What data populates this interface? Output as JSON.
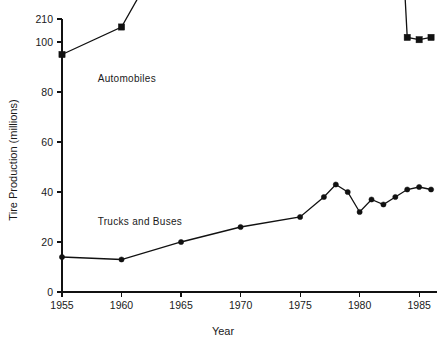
{
  "chart_data": {
    "type": "line",
    "title": "",
    "xlabel": "Year",
    "ylabel": "Tire Production (millions)",
    "xlim": [
      1955,
      1986.5
    ],
    "ylim": [
      0,
      210
    ],
    "grid": false,
    "legend_position": "inline-annotation",
    "x_ticks": [
      "1955",
      "1960",
      "1965",
      "1970",
      "1975",
      "1980",
      "1985"
    ],
    "x_tick_values": [
      1955,
      1960,
      1965,
      1970,
      1975,
      1980,
      1985
    ],
    "y_ticks": [
      "0",
      "20",
      "40",
      "60",
      "80",
      "100",
      "120",
      "140",
      "160",
      "180",
      "200",
      "210"
    ],
    "y_tick_values": [
      0,
      20,
      40,
      60,
      80,
      100,
      120,
      140,
      160,
      180,
      200,
      210
    ],
    "series": [
      {
        "name": "Automobiles",
        "marker": "square",
        "label_x": 1958.0,
        "label_y": 84,
        "x": [
          1955,
          1960,
          1965,
          1970,
          1975,
          1977,
          1978,
          1979,
          1980,
          1981,
          1982,
          1983,
          1984,
          1985,
          1986
        ],
        "values": [
          95,
          106,
          148,
          169,
          167,
          190,
          193,
          168,
          146,
          165,
          168,
          191,
          202,
          201,
          202
        ]
      },
      {
        "name": "Trucks and Buses",
        "marker": "circle",
        "label_x": 1958.0,
        "label_y": 27,
        "x": [
          1955,
          1960,
          1965,
          1970,
          1975,
          1977,
          1978,
          1979,
          1980,
          1981,
          1982,
          1983,
          1984,
          1985,
          1986
        ],
        "values": [
          14,
          13,
          20,
          26,
          30,
          38,
          43,
          40,
          32,
          37,
          35,
          38,
          41,
          42,
          41
        ]
      }
    ]
  },
  "axes": {
    "x_title": "Year",
    "y_title": "Tire Production (millions)"
  }
}
